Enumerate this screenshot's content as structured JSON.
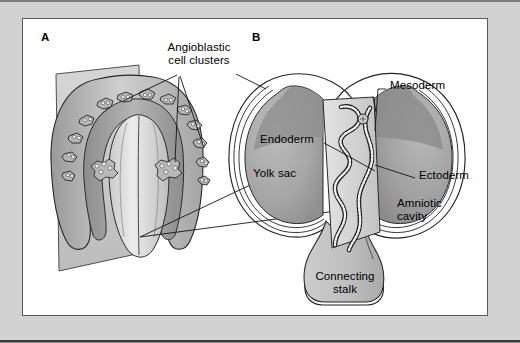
{
  "figure": {
    "panels": [
      {
        "id": "A",
        "letter": "A",
        "caption": "Dorsal view of embryonic disc with angioblastic cell clusters"
      },
      {
        "id": "B",
        "letter": "B",
        "caption": "Sagittal section of conceptus showing yolk sac and amniotic cavity"
      }
    ]
  },
  "labels": {
    "angioblastic": "Angioblastic\ncell clusters",
    "angioblastic_line1": "Angioblastic",
    "angioblastic_line2": "cell clusters",
    "mesoderm": "Mesoderm",
    "endoderm": "Endoderm",
    "ectoderm": "Ectoderm",
    "yolk_sac": "Yolk sac",
    "amniotic_cavity_line1": "Amniotic",
    "amniotic_cavity_line2": "cavity",
    "connecting_stalk_line1": "Connecting",
    "connecting_stalk_line2": "stalk"
  },
  "colors": {
    "page_margin": "#d2d2d2",
    "plate_background": "#ffffff",
    "plate_border": "#5a5a5a",
    "ink": "#1a1a1a",
    "tone_light": "#d8d8d8",
    "tone_pale": "#c6c6c6",
    "tone_mid": "#a8a8a8",
    "tone_dark": "#8e8e8e",
    "tone_darker": "#7d7d7d",
    "cell_fill": "#ffffff"
  },
  "panel_a": {
    "letter": "A",
    "description": "horseshoe-shaped embryonic disc on a tilted cut plane",
    "cluster_count": 22
  },
  "panel_b": {
    "letter": "B",
    "regions": [
      "yolk sac",
      "amniotic cavity",
      "connecting stalk"
    ],
    "germ_layers": [
      "Endoderm",
      "Mesoderm",
      "Ectoderm"
    ]
  }
}
